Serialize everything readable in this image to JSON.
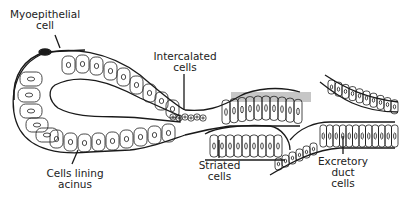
{
  "diagram": {
    "labels": {
      "myoepithelial": "Myoepithelial\ncell",
      "intercalated": "Intercalated\ncells",
      "cells_lining": "Cells lining\nacinus",
      "striated": "Striated\ncells",
      "excretory": "Excretory\nduct\ncells"
    },
    "colors": {
      "line": "#1a1a1a",
      "background": "#ffffff"
    }
  }
}
